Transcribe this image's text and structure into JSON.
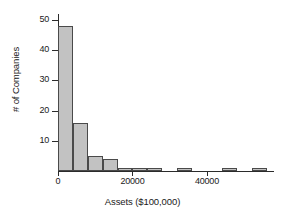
{
  "chart_data": {
    "type": "bar",
    "title": "",
    "subtitle": "",
    "xlabel": "Assets ($100,000)",
    "ylabel": "# of Companies",
    "xlim": [
      0,
      58000
    ],
    "ylim": [
      0,
      52
    ],
    "grid": false,
    "legend": null,
    "bin_width": 4000,
    "x_ticks": [
      {
        "value": 0,
        "label": "0"
      },
      {
        "value": 20000,
        "label": "20000"
      },
      {
        "value": 40000,
        "label": "40000"
      }
    ],
    "y_ticks": [
      {
        "value": 10,
        "label": "10"
      },
      {
        "value": 20,
        "label": "20"
      },
      {
        "value": 30,
        "label": "30"
      },
      {
        "value": 40,
        "label": "40"
      },
      {
        "value": 50,
        "label": "50"
      }
    ],
    "bins": [
      {
        "x_start": 0,
        "x_end": 4000,
        "count": 48
      },
      {
        "x_start": 4000,
        "x_end": 8000,
        "count": 16
      },
      {
        "x_start": 8000,
        "x_end": 12000,
        "count": 5
      },
      {
        "x_start": 12000,
        "x_end": 16000,
        "count": 4
      },
      {
        "x_start": 16000,
        "x_end": 20000,
        "count": 1
      },
      {
        "x_start": 20000,
        "x_end": 24000,
        "count": 1
      },
      {
        "x_start": 24000,
        "x_end": 28000,
        "count": 1
      },
      {
        "x_start": 32000,
        "x_end": 36000,
        "count": 1
      },
      {
        "x_start": 44000,
        "x_end": 48000,
        "count": 1
      },
      {
        "x_start": 52000,
        "x_end": 56000,
        "count": 1
      }
    ],
    "categories": [
      "0-4000",
      "4000-8000",
      "8000-12000",
      "12000-16000",
      "16000-20000",
      "20000-24000",
      "24000-28000",
      "32000-36000",
      "44000-48000",
      "52000-56000"
    ],
    "values": [
      48,
      16,
      5,
      4,
      1,
      1,
      1,
      1,
      1,
      1
    ],
    "colors": {
      "bar_fill": "#c2c2c2",
      "bar_edge": "#4a4a4a",
      "axis": "#2b2b2b",
      "text": "#1a1a1a",
      "background": "#ffffff"
    }
  }
}
